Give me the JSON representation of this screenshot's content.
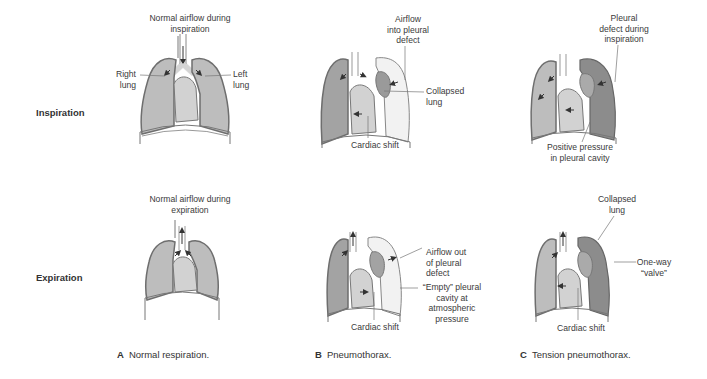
{
  "row_labels": {
    "inspiration": "Inspiration",
    "expiration": "Expiration"
  },
  "panels": {
    "A": {
      "letter": "A",
      "caption": "Normal respiration.",
      "inspiration_labels": {
        "airflow": [
          "Normal airflow during",
          "inspiration"
        ],
        "right_lung": [
          "Right",
          "lung"
        ],
        "left_lung": [
          "Left",
          "lung"
        ]
      },
      "expiration_labels": {
        "airflow": [
          "Normal airflow during",
          "expiration"
        ]
      }
    },
    "B": {
      "letter": "B",
      "caption": "Pneumothorax.",
      "inspiration_labels": {
        "airflow_in": [
          "Airflow",
          "into pleural",
          "defect"
        ],
        "collapsed_lung": [
          "Collapsed",
          "lung"
        ],
        "cardiac_shift": "Cardiac shift"
      },
      "expiration_labels": {
        "airflow_out": [
          "Airflow out",
          "of pleural",
          "defect"
        ],
        "empty_cavity": [
          "“Empty” pleural",
          "cavity at",
          "atmospheric",
          "pressure"
        ],
        "cardiac_shift": "Cardiac shift"
      }
    },
    "C": {
      "letter": "C",
      "caption": "Tension pneumothorax.",
      "inspiration_labels": {
        "pleural_defect": [
          "Pleural",
          "defect during",
          "inspiration"
        ],
        "positive_pressure": [
          "Positive pressure",
          "in pleural cavity"
        ]
      },
      "expiration_labels": {
        "collapsed_lung": [
          "Collapsed",
          "lung"
        ],
        "one_way_valve": [
          "One-way",
          "“valve”"
        ],
        "cardiac_shift": "Cardiac shift"
      }
    }
  },
  "colors": {
    "lung_fill": "#bdbdbd",
    "lung_outline": "#6e6e6e",
    "heart_fill": "#d2d2d2",
    "empty_cavity_fill": "#f2f2f2",
    "tension_lung_fill": "#8c8c8c",
    "collapsed_lung_fill": "#9a9a9a"
  }
}
